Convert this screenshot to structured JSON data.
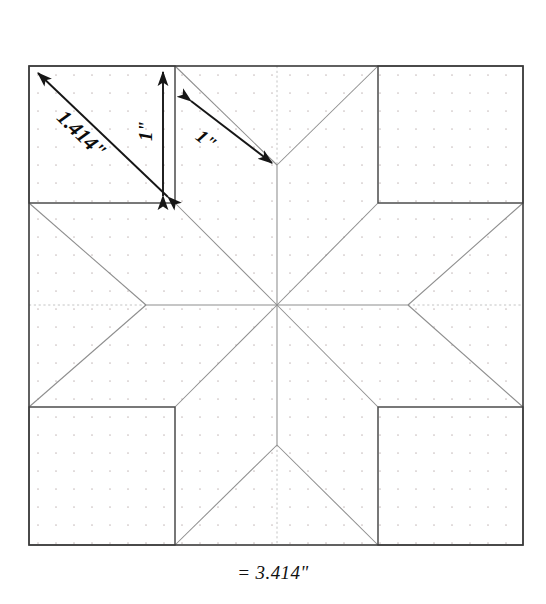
{
  "figure": {
    "title_top_row": {
      "segment_left": "1.00\"",
      "operator_1": "+",
      "segment_middle": "1.414\"",
      "operator_2": "+",
      "segment_right": "1.00\""
    },
    "total_label": "= 3.414\"",
    "dimension_annotations": {
      "corner_diagonal": "1.414\"",
      "corner_side_vertical": "1\"",
      "diamond_side": "1\""
    },
    "colors": {
      "paper": "#ffffff",
      "outline": "#3a3a3a",
      "piece_line": "#8a8a8a",
      "grid_dot": "#c9bfbf",
      "center_line": "#bdbdbd",
      "arrow": "#161616",
      "text": "#111111"
    },
    "geometry": {
      "square_left": 29,
      "square_top": 66,
      "square_right": 523,
      "square_bottom": 545,
      "corner_inner_x_left": 175,
      "corner_inner_x_right": 378,
      "corner_inner_y_top": 203,
      "corner_inner_y_bottom": 407,
      "center_x": 277,
      "center_y": 305,
      "grid_spacing": 18
    }
  }
}
